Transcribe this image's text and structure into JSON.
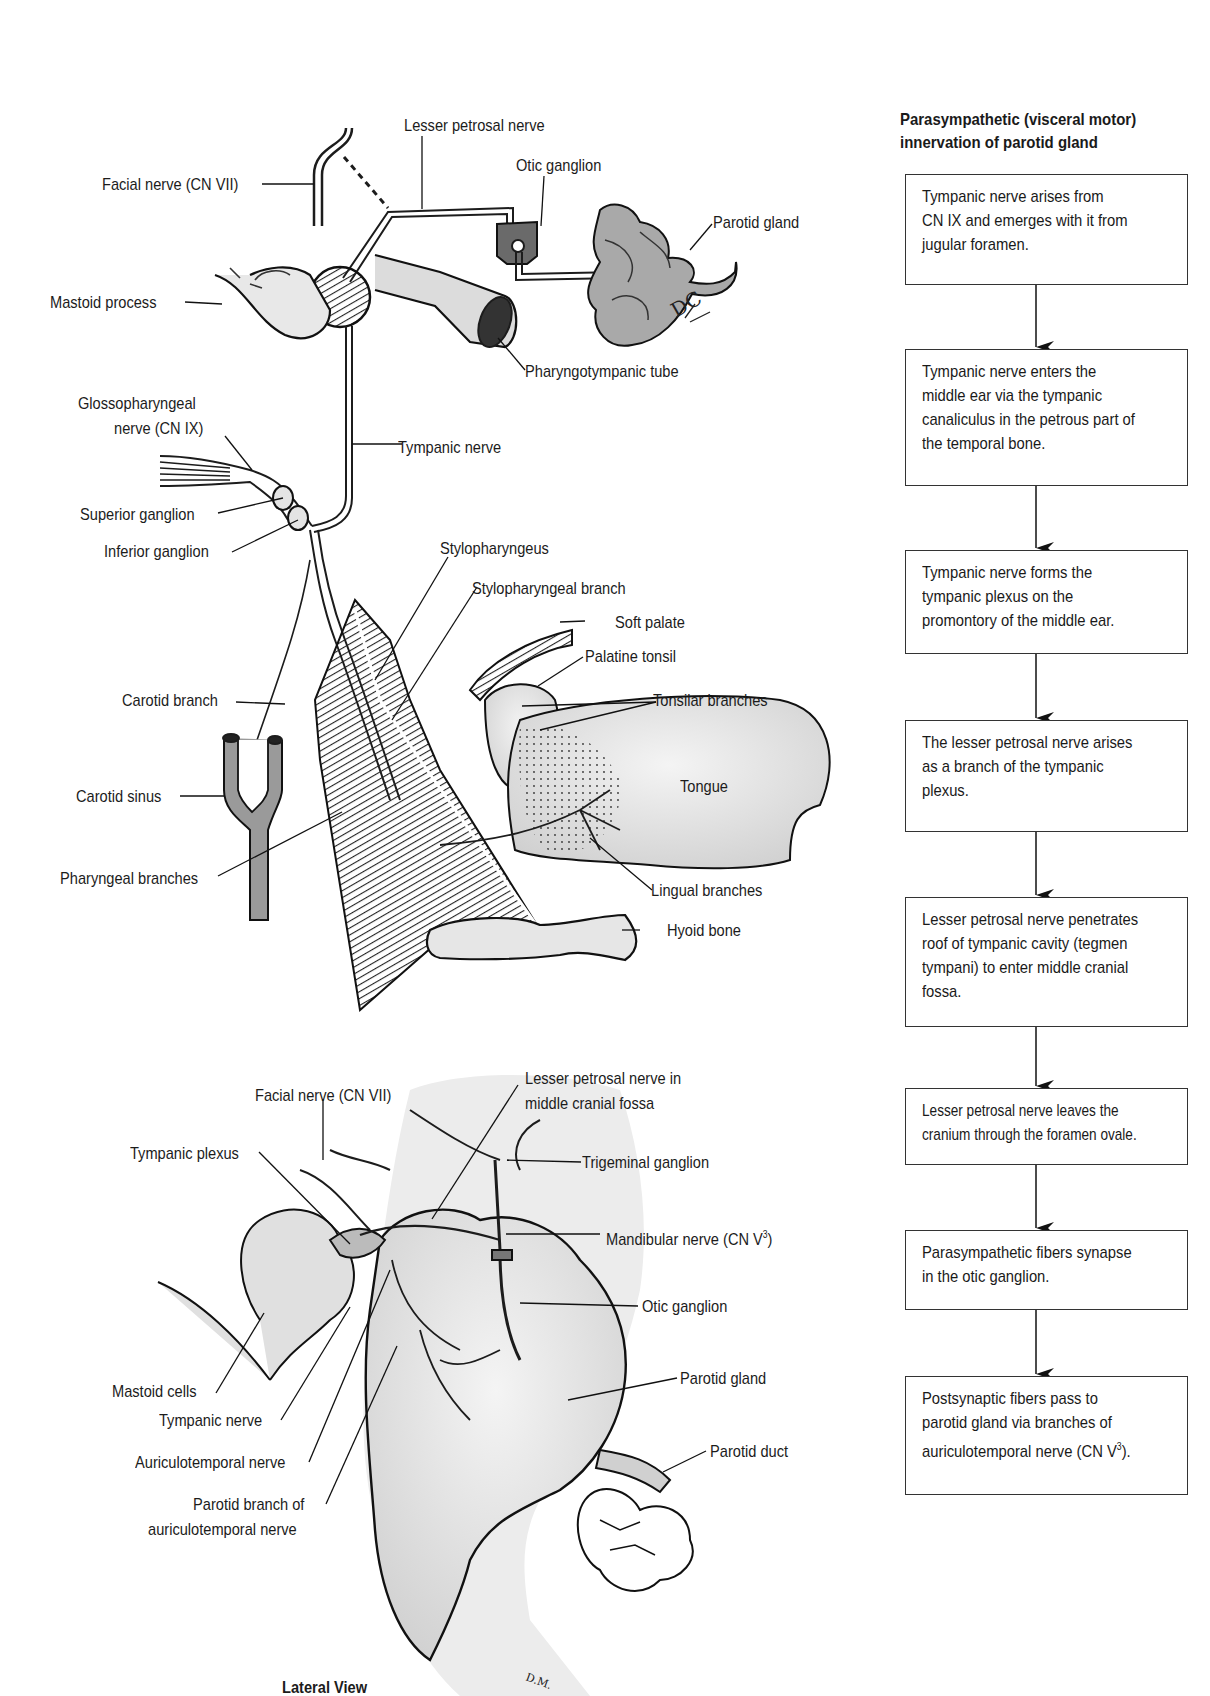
{
  "upper_diagram": {
    "labels": {
      "lesser_petrosal_nerve": "Lesser petrosal nerve",
      "otic_ganglion": "Otic ganglion",
      "facial_nerve": "Facial nerve (CN VII)",
      "parotid_gland": "Parotid gland",
      "mastoid_process": "Mastoid process",
      "pharyngotympanic_tube": "Pharyngotympanic tube",
      "glossopharyngeal_nerve_1": "Glossopharyngeal",
      "glossopharyngeal_nerve_2": "nerve (CN IX)",
      "tympanic_nerve": "Tympanic nerve",
      "superior_ganglion": "Superior ganglion",
      "inferior_ganglion": "Inferior ganglion",
      "stylopharyngeus": "Stylopharyngeus",
      "stylopharyngeal_branch": "Stylopharyngeal branch",
      "soft_palate": "Soft palate",
      "palatine_tonsil": "Palatine tonsil",
      "carotid_branch": "Carotid branch",
      "tonsilar_branches": "Tonsilar branches",
      "tongue": "Tongue",
      "carotid_sinus": "Carotid sinus",
      "pharyngeal_branches": "Pharyngeal branches",
      "lingual_branches": "Lingual branches",
      "hyoid_bone": "Hyoid bone"
    },
    "signature": "DC"
  },
  "lower_diagram": {
    "labels": {
      "lesser_petrosal_in_fossa_1": "Lesser petrosal nerve in",
      "lesser_petrosal_in_fossa_2": "middle cranial fossa",
      "facial_nerve": "Facial nerve (CN VII)",
      "tympanic_plexus": "Tympanic plexus",
      "trigeminal_ganglion": "Trigeminal ganglion",
      "mandibular_nerve": "Mandibular nerve (CN V",
      "mandibular_nerve_sup": "3",
      "mandibular_nerve_end": ")",
      "otic_ganglion": "Otic ganglion",
      "mastoid_cells": "Mastoid cells",
      "parotid_gland": "Parotid gland",
      "tympanic_nerve": "Tympanic nerve",
      "auriculotemporal_nerve": "Auriculotemporal nerve",
      "parotid_duct": "Parotid duct",
      "parotid_branch_1": "Parotid branch of",
      "parotid_branch_2": "auriculotemporal nerve"
    },
    "view_caption": "Lateral View",
    "signature": "D.M."
  },
  "flowchart": {
    "title": "Parasympathetic (visceral motor)\ninnervation of parotid gland",
    "steps": [
      "Tympanic nerve arises from\nCN IX and emerges with it from\njugular foramen.",
      "Tympanic nerve enters the\nmiddle ear via the tympanic\ncanaliculus in the petrous part of\nthe temporal bone.",
      "Tympanic nerve forms the\ntympanic plexus on the\npromontory of the middle ear.",
      "The lesser petrosal nerve arises\nas a branch of the tympanic\nplexus.",
      "Lesser petrosal nerve penetrates\nroof of tympanic cavity (tegmen\ntympani) to enter middle cranial\nfossa.",
      "Lesser petrosal nerve leaves the\ncranium through the foramen ovale.",
      "Parasympathetic fibers synapse\nin the otic ganglion.",
      "Postsynaptic fibers pass to\nparotid gland via branches of\nauriculotemporal nerve (CN V"
    ],
    "last_step_sup": "3",
    "last_step_end": ")."
  }
}
